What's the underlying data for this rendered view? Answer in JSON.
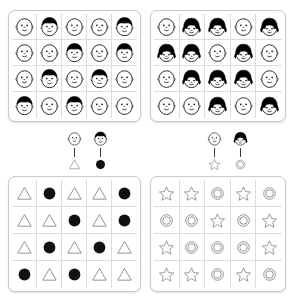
{
  "stimulus": {
    "title": "face-to-shape correspondence task",
    "colors": {
      "ink": "#1a1a1a",
      "hair": "#000000",
      "fill_solid": "#111111",
      "outline_light": "#8a8a8a",
      "panel_border": "#c9c9c9",
      "cell_border": "#dcdcdc",
      "background": "#ffffff"
    }
  },
  "panels": {
    "faces_left": {
      "name": "faces-grid-left",
      "rows": 4,
      "cols": 5,
      "icon_names": [
        "face-plain-icon",
        "face-hair-icon"
      ],
      "cells": [
        [
          "face-plain",
          "face-hair",
          "face-plain",
          "face-plain",
          "face-hair"
        ],
        [
          "face-plain",
          "face-plain",
          "face-hair",
          "face-plain",
          "face-hair"
        ],
        [
          "face-plain",
          "face-hair",
          "face-plain",
          "face-hair",
          "face-plain"
        ],
        [
          "face-hair",
          "face-plain",
          "face-hair",
          "face-plain",
          "face-plain"
        ]
      ]
    },
    "faces_right": {
      "name": "faces-grid-right",
      "rows": 4,
      "cols": 5,
      "icon_names": [
        "face-plain-icon",
        "face-bob-icon"
      ],
      "cells": [
        [
          "face-plain",
          "face-bob",
          "face-bob",
          "face-plain",
          "face-bob"
        ],
        [
          "face-bob",
          "face-bob",
          "face-plain",
          "face-bob",
          "face-plain"
        ],
        [
          "face-plain",
          "face-bob",
          "face-bob",
          "face-bob",
          "face-plain"
        ],
        [
          "face-plain",
          "face-plain",
          "face-bob",
          "face-plain",
          "face-bob"
        ]
      ]
    },
    "shapes_left": {
      "name": "shapes-grid-left",
      "rows": 4,
      "cols": 5,
      "icon_names": [
        "triangle-outline-icon",
        "circle-filled-icon"
      ],
      "cells": [
        [
          "triangle",
          "circle",
          "triangle",
          "triangle",
          "circle"
        ],
        [
          "triangle",
          "triangle",
          "circle",
          "triangle",
          "circle"
        ],
        [
          "triangle",
          "circle",
          "triangle",
          "circle",
          "triangle"
        ],
        [
          "circle",
          "triangle",
          "circle",
          "triangle",
          "triangle"
        ]
      ]
    },
    "shapes_right": {
      "name": "shapes-grid-right",
      "rows": 4,
      "cols": 5,
      "icon_names": [
        "star-outline-icon",
        "double-circle-icon"
      ],
      "cells": [
        [
          "star",
          "star",
          "circle",
          "star",
          "circle"
        ],
        [
          "circle",
          "circle",
          "star",
          "circle",
          "star"
        ],
        [
          "star",
          "circle",
          "circle",
          "circle",
          "star"
        ],
        [
          "star",
          "star",
          "circle",
          "star",
          "circle"
        ]
      ]
    }
  },
  "legends": {
    "left": {
      "name": "legend-left",
      "mappings": [
        {
          "face": "face-plain",
          "shape": "triangle"
        },
        {
          "face": "face-hair",
          "shape": "circle"
        }
      ]
    },
    "right": {
      "name": "legend-right",
      "mappings": [
        {
          "face": "face-plain",
          "shape": "star"
        },
        {
          "face": "face-bob",
          "shape": "circle"
        }
      ]
    }
  }
}
